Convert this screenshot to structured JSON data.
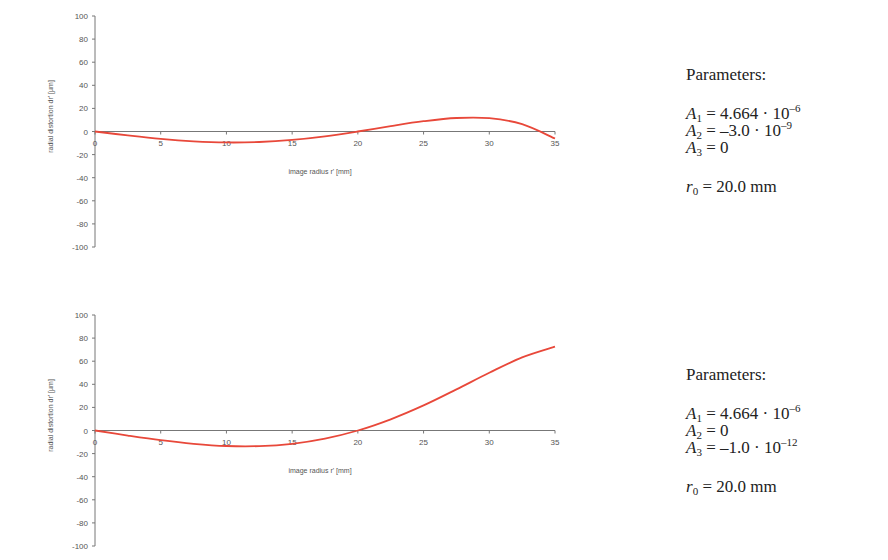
{
  "chart_data": [
    {
      "type": "line",
      "title": "",
      "xlabel": "image radius r' [mm]",
      "ylabel": "radial distortion dr' [µm]",
      "xlim": [
        0,
        35
      ],
      "ylim": [
        -100,
        100
      ],
      "xticks": [
        0,
        5,
        10,
        15,
        20,
        25,
        30,
        35
      ],
      "yticks": [
        100,
        80,
        60,
        40,
        20,
        0,
        -20,
        -40,
        -60,
        -80,
        -100
      ],
      "grid": false,
      "line_color": "#e8483a",
      "series": [
        {
          "name": "radial distortion",
          "x": [
            0,
            2.5,
            5,
            7.5,
            10,
            12.5,
            15,
            17.5,
            20,
            22.5,
            25,
            27.5,
            30,
            32.5,
            35
          ],
          "y": [
            0,
            -3.4,
            -6.4,
            -8.5,
            -9.5,
            -9.1,
            -7.3,
            -4.2,
            0,
            4.7,
            8.9,
            11.7,
            11.5,
            6.3,
            -6.1
          ]
        }
      ],
      "parameters": {
        "heading": "Parameters:",
        "A1": {
          "label": "A",
          "sub": "1",
          "value": " = 4.664 · 10",
          "exp": "–6"
        },
        "A2": {
          "label": "A",
          "sub": "2",
          "value": " = –3.0 · 10",
          "exp": "–9"
        },
        "A3": {
          "label": "A",
          "sub": "3",
          "value": " = 0",
          "exp": ""
        },
        "r0": {
          "label": "r",
          "sub": "0",
          "value": " = 20.0 mm"
        }
      }
    },
    {
      "type": "line",
      "title": "",
      "xlabel": "image radius r' [mm]",
      "ylabel": "radial distortion dr' [µm]",
      "xlim": [
        0,
        35
      ],
      "ylim": [
        -100,
        100
      ],
      "xticks": [
        0,
        5,
        10,
        15,
        20,
        25,
        30,
        35
      ],
      "yticks": [
        100,
        80,
        60,
        40,
        20,
        0,
        -20,
        -40,
        -60,
        -80,
        -100
      ],
      "grid": false,
      "line_color": "#e8483a",
      "series": [
        {
          "name": "radial distortion",
          "x": [
            0,
            2.5,
            5,
            7.5,
            10,
            12.5,
            15,
            17.5,
            20,
            22.5,
            25,
            27.5,
            30,
            32.5,
            35
          ],
          "y": [
            0,
            -4.4,
            -8.4,
            -11.5,
            -13.4,
            -13.5,
            -11.5,
            -7.0,
            0,
            9.7,
            21.7,
            35.6,
            50.0,
            63.3,
            72.6
          ]
        }
      ],
      "parameters": {
        "heading": "Parameters:",
        "A1": {
          "label": "A",
          "sub": "1",
          "value": " = 4.664 · 10",
          "exp": "–6"
        },
        "A2": {
          "label": "A",
          "sub": "2",
          "value": " = 0",
          "exp": ""
        },
        "A3": {
          "label": "A",
          "sub": "3",
          "value": " = –1.0 · 10",
          "exp": "–12"
        },
        "r0": {
          "label": "r",
          "sub": "0",
          "value": " = 20.0 mm"
        }
      }
    }
  ]
}
